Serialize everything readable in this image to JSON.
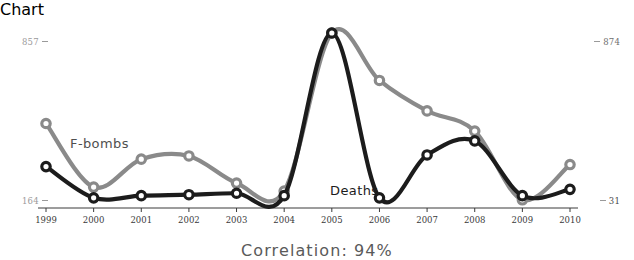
{
  "caption": "Correlation: 94%",
  "axis": {
    "top_left_value": "857",
    "top_right_value": "874",
    "bottom_left_value": "164",
    "bottom_right_value": "31"
  },
  "labels": {
    "fbombs": "F-bombs",
    "deaths": "Deaths"
  },
  "chart_data": {
    "type": "line",
    "title": "",
    "subtitle": "",
    "annotations": [
      "Correlation: 94%"
    ],
    "xlabel": "",
    "ylabel": "",
    "grid": false,
    "legend": "inline-labels",
    "categories": [
      "1999",
      "2000",
      "2001",
      "2002",
      "2003",
      "2004",
      "2005",
      "2006",
      "2007",
      "2008",
      "2009",
      "2010"
    ],
    "x": [
      1999,
      2000,
      2001,
      2002,
      2003,
      2004,
      2005,
      2006,
      2007,
      2008,
      2009,
      2010
    ],
    "series": [
      {
        "name": "F-bombs",
        "color": "#8a8a8a",
        "axis": "right",
        "ylim": [
          31,
          874
        ],
        "values": [
          420,
          101,
          241,
          257,
          121,
          81,
          874,
          636,
          483,
          382,
          37,
          214
        ]
      },
      {
        "name": "Deaths",
        "color": "#1c1c1c",
        "axis": "left",
        "ylim": [
          164,
          857
        ],
        "values": [
          306,
          177,
          186,
          190,
          196,
          186,
          857,
          177,
          354,
          412,
          186,
          212
        ]
      }
    ]
  }
}
